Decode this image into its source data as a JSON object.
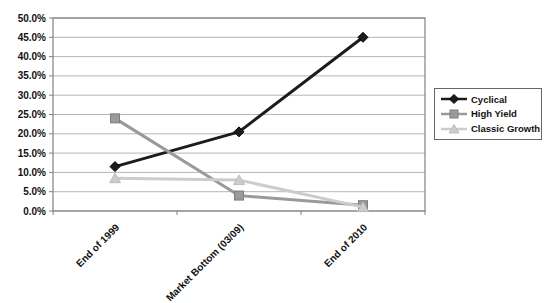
{
  "chart_data": {
    "type": "line",
    "categories": [
      "End of 1999",
      "Market Bottom (03/09)",
      "End of 2010"
    ],
    "series": [
      {
        "name": "Cyclical",
        "values": [
          11.5,
          20.5,
          45.0
        ],
        "color": "#1c1c1c",
        "edge": "#000000",
        "marker": "diamond"
      },
      {
        "name": "High Yield",
        "values": [
          24.0,
          4.0,
          1.5
        ],
        "color": "#9a9a9a",
        "edge": "#7d7d7d",
        "marker": "square"
      },
      {
        "name": "Classic Growth",
        "values": [
          8.5,
          8.0,
          1.0
        ],
        "color": "#cccccc",
        "edge": "#bdbdbd",
        "marker": "triangle"
      }
    ],
    "xlabel": "",
    "ylabel": "",
    "ylim": [
      0,
      50
    ],
    "y_tick_step": 5,
    "y_tick_labels": [
      "0.0%",
      "5.0%",
      "10.0%",
      "15.0%",
      "20.0%",
      "25.0%",
      "30.0%",
      "35.0%",
      "40.0%",
      "45.0%",
      "50.0%"
    ],
    "grid": true,
    "legend_position": "right"
  },
  "colors": {
    "background": "#ffffff",
    "gridline": "#b6b6b6",
    "plot_border": "#808080",
    "axis_text": "#111111",
    "legend_border": "#666666"
  }
}
